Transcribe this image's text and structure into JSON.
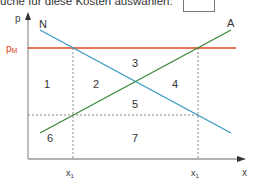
{
  "header": {
    "instruction_text": "üche für diese Kosten auswählen:",
    "answer_box_value": ""
  },
  "diagram": {
    "y_axis_label": "p",
    "x_axis_label": "x",
    "market_price_label": "pM",
    "market_price_label_main": "p",
    "market_price_label_sub": "M",
    "demand_label": "N",
    "supply_label": "A",
    "x_tick_left": "x1",
    "x_tick_right": "x1",
    "x_tick_main": "x",
    "x_tick_sub": "1",
    "regions": [
      "1",
      "2",
      "3",
      "4",
      "5",
      "6",
      "7"
    ],
    "colors": {
      "demand": "#3a9bc4",
      "supply": "#3a8a3a",
      "market_price": "#e0451e",
      "axis": "#888888",
      "dashed": "#777777",
      "market_price_label": "#e0451e"
    }
  }
}
